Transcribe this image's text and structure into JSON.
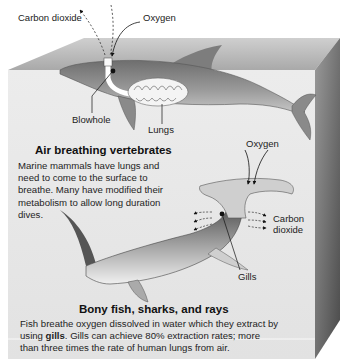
{
  "figure": {
    "top_section": {
      "labels": {
        "carbon_dioxide": "Carbon dioxide",
        "oxygen": "Oxygen",
        "blowhole": "Blowhole",
        "lungs": "Lungs"
      },
      "heading": "Air breathing vertebrates",
      "description": "Marine mammals have lungs and need to come to the surface to breathe. Many have modified their metabolism to allow long duration dives."
    },
    "bottom_section": {
      "labels": {
        "oxygen": "Oxygen",
        "carbon_dioxide_line1": "Carbon",
        "carbon_dioxide_line2": "dioxide",
        "gills": "Gills"
      },
      "heading": "Bony fish, sharks, and rays",
      "description_part1": "Fish breathe oxygen dissolved in water which they extract by using ",
      "description_bold": "gills",
      "description_part2": ". Gills can achieve 80% extraction rates; more than three times the rate of human lungs from air."
    },
    "illustrations": {
      "top_animal": "dolphin",
      "bottom_animal": "hammerhead-shark"
    },
    "colors": {
      "box_front": "#e9e9e9",
      "box_top": "#b5b5b5",
      "box_side": "#6f6f6f",
      "animal_body": "#8c8c8c"
    }
  }
}
